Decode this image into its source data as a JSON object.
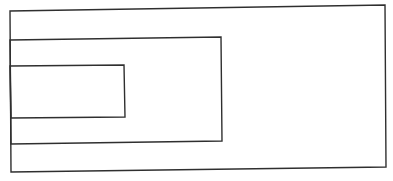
{
  "diagram": {
    "type": "nested-rectangles",
    "stroke_color": "#2f2f2f",
    "background_color": "#ffffff",
    "shapes": [
      {
        "id": "outer",
        "label": ""
      },
      {
        "id": "middle",
        "label": ""
      },
      {
        "id": "inner",
        "label": ""
      }
    ]
  }
}
